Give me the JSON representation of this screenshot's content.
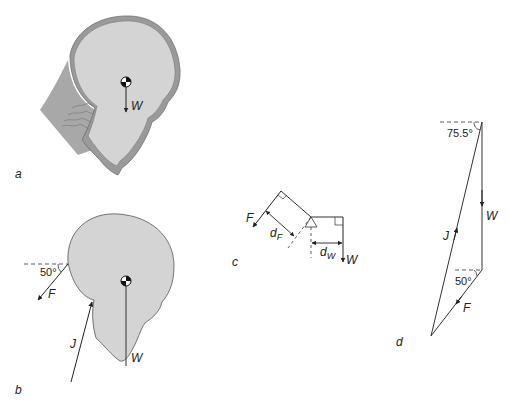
{
  "panels": {
    "a": {
      "label": "a",
      "weight_label": "W"
    },
    "b": {
      "label": "b",
      "angle_label": "50°",
      "force_f_label": "F",
      "force_j_label": "J",
      "weight_label": "W"
    },
    "c": {
      "label": "c",
      "force_f_label": "F",
      "df_label": "d",
      "df_sub": "F",
      "dw_label": "d",
      "dw_sub": "W",
      "weight_label": "W"
    },
    "d": {
      "label": "d",
      "top_angle_label": "75.5°",
      "bottom_angle_label": "50°",
      "force_w_label": "W",
      "force_j_label": "J",
      "force_f_label": "F"
    }
  },
  "colors": {
    "head_fill": "#d4d4d4",
    "head_outline": "#8a8a8a",
    "skin_band": "#9a9a9a",
    "line": "#333333",
    "background": "#ffffff"
  }
}
